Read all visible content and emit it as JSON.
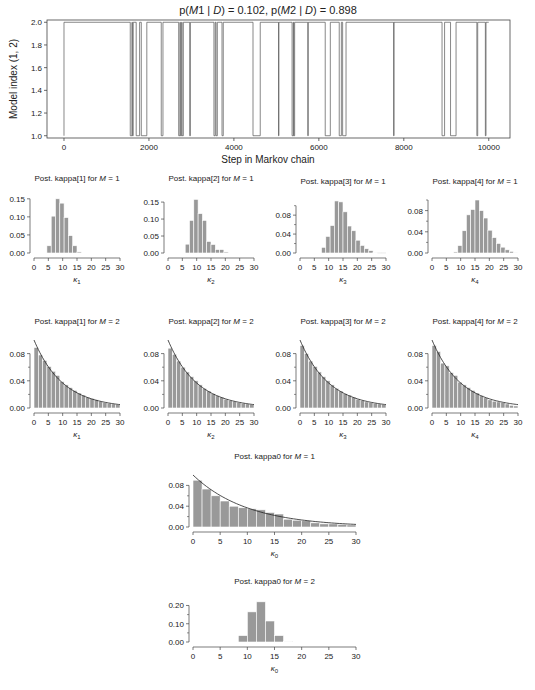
{
  "figure": {
    "background": "#ffffff",
    "bar_fill": "#999999",
    "bar_edge": "#ffffff",
    "line_color": "#222222",
    "axis_color": "#444444"
  },
  "chart_data": [
    {
      "id": "trace",
      "type": "line",
      "title": "p(M1 | D) = 0.102, p(M2 | D) = 0.898",
      "title_parts": [
        "p(",
        "M",
        "1 | ",
        "D",
        ") = 0.102, p(",
        "M",
        "2 | ",
        "D",
        ") = 0.898"
      ],
      "xlabel": "Step in Markov chain",
      "ylabel": "Model index (1, 2)",
      "xlim": [
        -400,
        10500
      ],
      "ylim": [
        0.98,
        2.02
      ],
      "xticks": [
        0,
        2000,
        4000,
        6000,
        8000,
        10000
      ],
      "yticks": [
        1.0,
        1.2,
        1.4,
        1.6,
        1.8,
        2.0
      ],
      "ytick_labels": [
        "1.0",
        "1.2",
        "1.4",
        "1.6",
        "1.8",
        "2.0"
      ],
      "box": true,
      "x_start": 0,
      "x_end": 10000,
      "model1_intervals": [
        [
          0,
          5
        ],
        [
          1560,
          1600
        ],
        [
          1610,
          1630
        ],
        [
          1700,
          1780
        ],
        [
          1820,
          1950
        ],
        [
          2290,
          2330
        ],
        [
          2700,
          2730
        ],
        [
          2740,
          2770
        ],
        [
          2780,
          2810
        ],
        [
          2960,
          2975
        ],
        [
          3530,
          3560
        ],
        [
          3580,
          3610
        ],
        [
          3720,
          3750
        ],
        [
          4450,
          4620
        ],
        [
          5050,
          5060
        ],
        [
          5370,
          5400
        ],
        [
          5410,
          5430
        ],
        [
          5740,
          5750
        ],
        [
          6150,
          6270
        ],
        [
          6480,
          6530
        ],
        [
          6560,
          6640
        ],
        [
          7760,
          7770
        ],
        [
          8900,
          8960
        ],
        [
          9100,
          9230
        ],
        [
          9720,
          9740
        ],
        [
          9920,
          9935
        ]
      ],
      "summary": {
        "p_M1_given_D": 0.102,
        "p_M2_given_D": 0.898
      }
    },
    {
      "id": "k1m1",
      "type": "bar",
      "title_prefix": "Post. kappa[1] for ",
      "title_var": "M",
      "title_suffix": " = 1",
      "xlabel": "κ",
      "xlabel_sub": "1",
      "xlim": [
        0,
        30
      ],
      "ylim": [
        0,
        0.155
      ],
      "xticks": [
        0,
        5,
        10,
        15,
        20,
        25,
        30
      ],
      "yticks": [
        0,
        0.05,
        0.1,
        0.15
      ],
      "ytick_labels": [
        "0.00",
        "0.05",
        "0.10",
        "0.15"
      ],
      "minor_yticks": [],
      "bin_width": 1.5,
      "bin_starts": [
        4.5,
        6,
        7.5,
        9,
        10.5,
        12,
        13.5,
        15
      ],
      "values": [
        0.02,
        0.102,
        0.15,
        0.138,
        0.098,
        0.048,
        0.02,
        0.003
      ],
      "curve": null
    },
    {
      "id": "k2m1",
      "type": "bar",
      "title_prefix": "Post. kappa[2] for ",
      "title_var": "M",
      "title_suffix": " = 1",
      "xlabel": "κ",
      "xlabel_sub": "2",
      "xlim": [
        0,
        30
      ],
      "ylim": [
        0,
        0.165
      ],
      "xticks": [
        0,
        5,
        10,
        15,
        20,
        25,
        30
      ],
      "yticks": [
        0,
        0.05,
        0.1,
        0.15
      ],
      "ytick_labels": [
        "0.00",
        "0.05",
        "0.10",
        "0.15"
      ],
      "minor_yticks": [],
      "bin_width": 1.5,
      "bin_starts": [
        6,
        7.5,
        9,
        10.5,
        12,
        13.5,
        15,
        16.5,
        18,
        19.5
      ],
      "values": [
        0.026,
        0.096,
        0.158,
        0.116,
        0.096,
        0.034,
        0.025,
        0.01,
        0.01,
        0.003
      ],
      "curve": null
    },
    {
      "id": "k3m1",
      "type": "bar",
      "title_prefix": "Post. kappa[3] for ",
      "title_var": "M",
      "title_suffix": " = 1",
      "xlabel": "κ",
      "xlabel_sub": "3",
      "xlim": [
        0,
        30
      ],
      "ylim": [
        0,
        0.112
      ],
      "xticks": [
        0,
        5,
        10,
        15,
        20,
        25,
        30
      ],
      "yticks": [
        0,
        0.04,
        0.08
      ],
      "ytick_labels": [
        "0.00",
        "0.04",
        "0.08"
      ],
      "minor_yticks": [
        0.02,
        0.06,
        0.1
      ],
      "bin_width": 1.5,
      "bin_starts": [
        7.5,
        9,
        10.5,
        12,
        13.5,
        15,
        16.5,
        18,
        19.5,
        21,
        22.5,
        24,
        25.5,
        27,
        28.5
      ],
      "values": [
        0.012,
        0.035,
        0.058,
        0.11,
        0.108,
        0.087,
        0.057,
        0.047,
        0.027,
        0.016,
        0.009,
        0.005,
        0.001,
        0.0005,
        0.0005
      ],
      "curve": null
    },
    {
      "id": "k4m1",
      "type": "bar",
      "title_prefix": "Post. kappa[4] for ",
      "title_var": "M",
      "title_suffix": " = 1",
      "xlabel": "κ",
      "xlabel_sub": "4",
      "xlim": [
        0,
        30
      ],
      "ylim": [
        0,
        0.1
      ],
      "xticks": [
        0,
        5,
        10,
        15,
        20,
        25,
        30
      ],
      "yticks": [
        0,
        0.04,
        0.08
      ],
      "ytick_labels": [
        "0.00",
        "0.04",
        "0.08"
      ],
      "minor_yticks": [
        0.02,
        0.06,
        0.1
      ],
      "bin_width": 1.5,
      "bin_starts": [
        7.5,
        9,
        10.5,
        12,
        13.5,
        15,
        16.5,
        18,
        19.5,
        21,
        22.5,
        24,
        25.5,
        27,
        28.5
      ],
      "values": [
        0.002,
        0.014,
        0.042,
        0.072,
        0.082,
        0.1,
        0.08,
        0.066,
        0.043,
        0.029,
        0.018,
        0.011,
        0.006,
        0.003,
        0.001
      ],
      "curve": null
    },
    {
      "id": "k1m2",
      "type": "bar",
      "title_prefix": "Post. kappa[1] for ",
      "title_var": "M",
      "title_suffix": " = 2",
      "xlabel": "κ",
      "xlabel_sub": "1",
      "xlim": [
        0,
        30
      ],
      "ylim": [
        0,
        0.1
      ],
      "xticks": [
        0,
        5,
        10,
        15,
        20,
        25,
        30
      ],
      "yticks": [
        0,
        0.04,
        0.08
      ],
      "ytick_labels": [
        "0.00",
        "0.04",
        "0.08"
      ],
      "minor_yticks": [
        0.02,
        0.06
      ],
      "bin_width": 1.5,
      "bin_starts": [
        0,
        1.5,
        3,
        4.5,
        6,
        7.5,
        9,
        10.5,
        12,
        13.5,
        15,
        16.5,
        18,
        19.5,
        21,
        22.5,
        24,
        25.5,
        27,
        28.5
      ],
      "values": [
        0.089,
        0.078,
        0.07,
        0.061,
        0.054,
        0.048,
        0.039,
        0.034,
        0.03,
        0.026,
        0.022,
        0.019,
        0.016,
        0.014,
        0.012,
        0.01,
        0.008,
        0.007,
        0.006,
        0.005
      ],
      "curve": {
        "type": "exponential",
        "rate": 0.1,
        "scale": 0.1
      }
    },
    {
      "id": "k2m2",
      "type": "bar",
      "title_prefix": "Post. kappa[2] for ",
      "title_var": "M",
      "title_suffix": " = 2",
      "xlabel": "κ",
      "xlabel_sub": "2",
      "xlim": [
        0,
        30
      ],
      "ylim": [
        0,
        0.1
      ],
      "xticks": [
        0,
        5,
        10,
        15,
        20,
        25,
        30
      ],
      "yticks": [
        0,
        0.04,
        0.08
      ],
      "ytick_labels": [
        "0.00",
        "0.04",
        "0.08"
      ],
      "minor_yticks": [
        0.02,
        0.06
      ],
      "bin_width": 1.5,
      "bin_starts": [
        0,
        1.5,
        3,
        4.5,
        6,
        7.5,
        9,
        10.5,
        12,
        13.5,
        15,
        16.5,
        18,
        19.5,
        21,
        22.5,
        24,
        25.5,
        27,
        28.5
      ],
      "values": [
        0.088,
        0.079,
        0.069,
        0.06,
        0.053,
        0.046,
        0.04,
        0.034,
        0.029,
        0.025,
        0.021,
        0.018,
        0.016,
        0.013,
        0.011,
        0.01,
        0.008,
        0.007,
        0.006,
        0.005
      ],
      "curve": {
        "type": "exponential",
        "rate": 0.1,
        "scale": 0.1
      }
    },
    {
      "id": "k3m2",
      "type": "bar",
      "title_prefix": "Post. kappa[3] for ",
      "title_var": "M",
      "title_suffix": " = 2",
      "xlabel": "κ",
      "xlabel_sub": "3",
      "xlim": [
        0,
        30
      ],
      "ylim": [
        0,
        0.1
      ],
      "xticks": [
        0,
        5,
        10,
        15,
        20,
        25,
        30
      ],
      "yticks": [
        0,
        0.04,
        0.08
      ],
      "ytick_labels": [
        "0.00",
        "0.04",
        "0.08"
      ],
      "minor_yticks": [
        0.02,
        0.06
      ],
      "bin_width": 1.5,
      "bin_starts": [
        0,
        1.5,
        3,
        4.5,
        6,
        7.5,
        9,
        10.5,
        12,
        13.5,
        15,
        16.5,
        18,
        19.5,
        21,
        22.5,
        24,
        25.5,
        27,
        28.5
      ],
      "values": [
        0.092,
        0.08,
        0.069,
        0.061,
        0.053,
        0.046,
        0.04,
        0.034,
        0.029,
        0.025,
        0.021,
        0.019,
        0.016,
        0.013,
        0.011,
        0.009,
        0.008,
        0.007,
        0.006,
        0.005
      ],
      "curve": {
        "type": "exponential",
        "rate": 0.1,
        "scale": 0.1
      }
    },
    {
      "id": "k4m2",
      "type": "bar",
      "title_prefix": "Post. kappa[4] for ",
      "title_var": "M",
      "title_suffix": " = 2",
      "xlabel": "κ",
      "xlabel_sub": "4",
      "xlim": [
        0,
        30
      ],
      "ylim": [
        0,
        0.1
      ],
      "xticks": [
        0,
        5,
        10,
        15,
        20,
        25,
        30
      ],
      "yticks": [
        0,
        0.04,
        0.08
      ],
      "ytick_labels": [
        "0.00",
        "0.04",
        "0.08"
      ],
      "minor_yticks": [
        0.02,
        0.06
      ],
      "bin_width": 1.5,
      "bin_starts": [
        0,
        1.5,
        3,
        4.5,
        6,
        7.5,
        9,
        10.5,
        12,
        13.5,
        15,
        16.5,
        18,
        19.5,
        21,
        22.5,
        24,
        25.5,
        27,
        28.5
      ],
      "values": [
        0.092,
        0.083,
        0.066,
        0.062,
        0.052,
        0.048,
        0.038,
        0.034,
        0.03,
        0.026,
        0.022,
        0.018,
        0.015,
        0.012,
        0.01,
        0.009,
        0.008,
        0.006,
        0.004,
        0.003
      ],
      "curve": {
        "type": "exponential",
        "rate": 0.1,
        "scale": 0.1
      }
    },
    {
      "id": "k0m1",
      "type": "bar",
      "title_prefix": "Post. kappa0 for ",
      "title_var": "M",
      "title_suffix": " = 1",
      "xlabel": "κ",
      "xlabel_sub": "0",
      "xlim": [
        0,
        30
      ],
      "ylim": [
        0,
        0.1
      ],
      "xticks": [
        0,
        5,
        10,
        15,
        20,
        25,
        30
      ],
      "yticks": [
        0,
        0.04,
        0.08
      ],
      "ytick_labels": [
        "0.00",
        "0.04",
        "0.08"
      ],
      "minor_yticks": [
        0.02,
        0.06
      ],
      "bin_width": 1.667,
      "bin_starts": [
        0,
        1.667,
        3.333,
        5,
        6.667,
        8.333,
        10,
        11.667,
        13.333,
        15,
        16.667,
        18.333,
        20,
        21.667,
        23.333,
        25,
        26.667,
        28.333
      ],
      "values": [
        0.09,
        0.073,
        0.06,
        0.05,
        0.04,
        0.037,
        0.035,
        0.033,
        0.028,
        0.025,
        0.015,
        0.013,
        0.012,
        0.008,
        0.006,
        0.006,
        0.005,
        0.004
      ],
      "curve": {
        "type": "exponential",
        "rate": 0.1,
        "scale": 0.1
      }
    },
    {
      "id": "k0m2",
      "type": "bar",
      "title_prefix": "Post. kappa0 for ",
      "title_var": "M",
      "title_suffix": " = 2",
      "xlabel": "κ",
      "xlabel_sub": "0",
      "xlim": [
        0,
        30
      ],
      "ylim": [
        0,
        0.23
      ],
      "xticks": [
        0,
        5,
        10,
        15,
        20,
        25,
        30
      ],
      "yticks": [
        0,
        0.1,
        0.2
      ],
      "ytick_labels": [
        "0.00",
        "0.10",
        "0.20"
      ],
      "minor_yticks": [
        0.05,
        0.15
      ],
      "bin_width": 1.667,
      "bin_starts": [
        8.333,
        10,
        11.667,
        13.333,
        15,
        16.667
      ],
      "values": [
        0.035,
        0.165,
        0.22,
        0.115,
        0.035,
        0.003
      ],
      "curve": null
    }
  ],
  "layout_panels": {
    "trace": {
      "x": 47,
      "y": 20,
      "w": 463,
      "h": 118
    },
    "k1m1": {
      "x": 34,
      "y": 197,
      "w": 86,
      "h": 56
    },
    "k2m1": {
      "x": 168,
      "y": 197,
      "w": 86,
      "h": 56
    },
    "k3m1": {
      "x": 300,
      "y": 200,
      "w": 86,
      "h": 53
    },
    "k4m1": {
      "x": 432,
      "y": 200,
      "w": 86,
      "h": 53
    },
    "k1m2": {
      "x": 34,
      "y": 340,
      "w": 86,
      "h": 68
    },
    "k2m2": {
      "x": 168,
      "y": 340,
      "w": 86,
      "h": 68
    },
    "k3m2": {
      "x": 300,
      "y": 340,
      "w": 86,
      "h": 68
    },
    "k4m2": {
      "x": 432,
      "y": 340,
      "w": 86,
      "h": 68
    },
    "k0m1": {
      "x": 193,
      "y": 475,
      "w": 163,
      "h": 52
    },
    "k0m2": {
      "x": 193,
      "y": 600,
      "w": 163,
      "h": 42
    }
  }
}
